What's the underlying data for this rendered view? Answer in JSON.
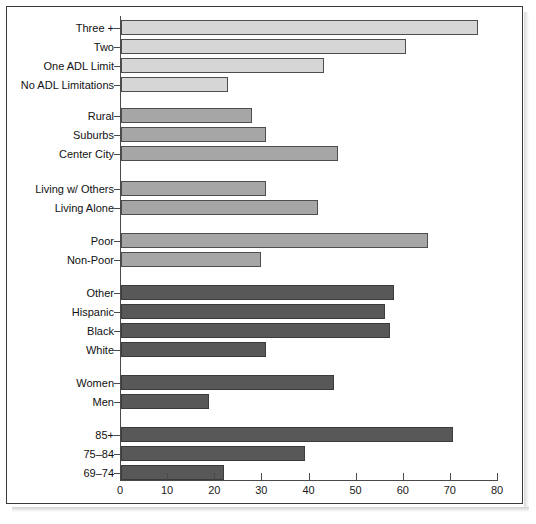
{
  "chart_data": {
    "type": "bar",
    "orientation": "horizontal",
    "title": "",
    "subtitle": "",
    "xlabel": "",
    "ylabel": "",
    "xlim": [
      0,
      80
    ],
    "xticks": [
      0,
      10,
      20,
      30,
      40,
      50,
      60,
      70,
      80
    ],
    "xticklabels": [
      "0",
      "10",
      "20",
      "30",
      "40",
      "50",
      "60",
      "70",
      "80"
    ],
    "grid": false,
    "legend": "none",
    "categories": [
      "Three +",
      "Two",
      "One ADL Limit",
      "No ADL Limitations",
      "Rural",
      "Suburbs",
      "Center City",
      "Living w/ Others",
      "Living Alone",
      "Poor",
      "Non-Poor",
      "Other",
      "Hispanic",
      "Black",
      "White",
      "Women",
      "Men",
      "85+",
      "75–84",
      "69–74"
    ],
    "values": [
      75.8,
      60.5,
      43.0,
      22.7,
      27.8,
      30.8,
      46.0,
      30.8,
      41.8,
      65.2,
      29.7,
      58.0,
      56.0,
      57.1,
      30.8,
      45.2,
      18.7,
      70.5,
      39.0,
      21.9
    ],
    "groups": [
      {
        "name": "ADL Limitations",
        "shade": "light",
        "categories": [
          "Three +",
          "Two",
          "One ADL Limit",
          "No ADL Limitations"
        ]
      },
      {
        "name": "Residence",
        "shade": "mid",
        "categories": [
          "Rural",
          "Suburbs",
          "Center City"
        ]
      },
      {
        "name": "Living Arrangement",
        "shade": "mid",
        "categories": [
          "Living w/ Others",
          "Living Alone"
        ]
      },
      {
        "name": "Poverty Status",
        "shade": "mid",
        "categories": [
          "Poor",
          "Non-Poor"
        ]
      },
      {
        "name": "Race / Ethnicity",
        "shade": "dark",
        "categories": [
          "Other",
          "Hispanic",
          "Black",
          "White"
        ]
      },
      {
        "name": "Sex",
        "shade": "dark",
        "categories": [
          "Women",
          "Men"
        ]
      },
      {
        "name": "Age",
        "shade": "dark",
        "categories": [
          "85+",
          "75–84",
          "69–74"
        ]
      }
    ],
    "bars": [
      {
        "label": "Three +",
        "value": 75.8,
        "shade": "light",
        "top": 20,
        "height": 15
      },
      {
        "label": "Two",
        "value": 60.5,
        "shade": "light",
        "top": 39,
        "height": 15
      },
      {
        "label": "One ADL Limit",
        "value": 43.0,
        "shade": "light",
        "top": 58,
        "height": 15
      },
      {
        "label": "No ADL Limitations",
        "value": 22.7,
        "shade": "light",
        "top": 77,
        "height": 15
      },
      {
        "label": "Rural",
        "value": 27.8,
        "shade": "mid",
        "top": 108,
        "height": 15
      },
      {
        "label": "Suburbs",
        "value": 30.8,
        "shade": "mid",
        "top": 127,
        "height": 15
      },
      {
        "label": "Center City",
        "value": 46.0,
        "shade": "mid",
        "top": 146,
        "height": 15
      },
      {
        "label": "Living w/ Others",
        "value": 30.8,
        "shade": "mid",
        "top": 181,
        "height": 15
      },
      {
        "label": "Living Alone",
        "value": 41.8,
        "shade": "mid",
        "top": 200,
        "height": 15
      },
      {
        "label": "Poor",
        "value": 65.2,
        "shade": "mid",
        "top": 233,
        "height": 15
      },
      {
        "label": "Non-Poor",
        "value": 29.7,
        "shade": "mid",
        "top": 252,
        "height": 15
      },
      {
        "label": "Other",
        "value": 58.0,
        "shade": "dark",
        "top": 285,
        "height": 15
      },
      {
        "label": "Hispanic",
        "value": 56.0,
        "shade": "dark",
        "top": 304,
        "height": 15
      },
      {
        "label": "Black",
        "value": 57.1,
        "shade": "dark",
        "top": 323,
        "height": 15
      },
      {
        "label": "White",
        "value": 30.8,
        "shade": "dark",
        "top": 342,
        "height": 15
      },
      {
        "label": "Women",
        "value": 45.2,
        "shade": "dark",
        "top": 375,
        "height": 15
      },
      {
        "label": "Men",
        "value": 18.7,
        "shade": "dark",
        "top": 394,
        "height": 15
      },
      {
        "label": "85+",
        "value": 70.5,
        "shade": "dark",
        "top": 427,
        "height": 15
      },
      {
        "label": "75–84",
        "value": 39.0,
        "shade": "dark",
        "top": 446,
        "height": 15
      },
      {
        "label": "69–74",
        "value": 21.9,
        "shade": "dark",
        "top": 465,
        "height": 15
      }
    ],
    "colors": {
      "light": "#d6d6d6",
      "mid": "#a6a6a6",
      "dark": "#585858",
      "axis": "#4a4a4a",
      "frame": "#3a3a3a",
      "text": "#111111",
      "background": "#ffffff"
    }
  }
}
